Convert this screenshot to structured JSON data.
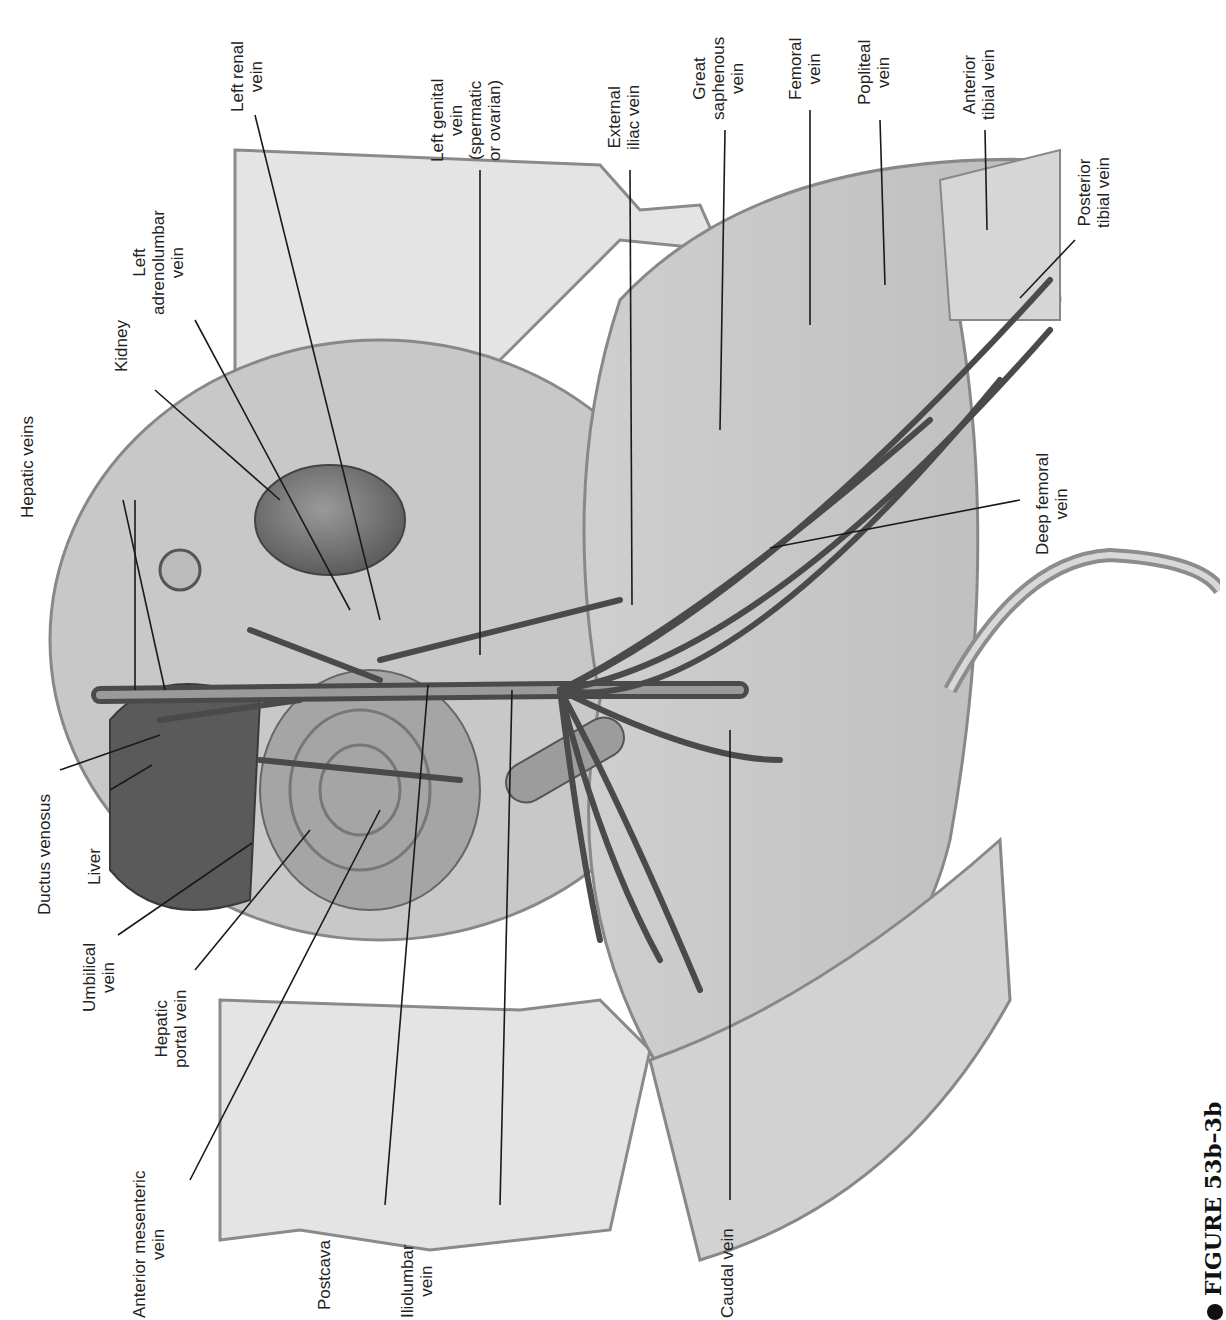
{
  "figure": {
    "caption": "FIGURE 53b–3b"
  },
  "labels": {
    "hepatic_veins": [
      "Hepatic veins"
    ],
    "kidney": [
      "Kidney"
    ],
    "left_adrenolumbar_vein": [
      "Left",
      "adrenolumbar",
      "vein"
    ],
    "left_renal_vein": [
      "Left renal",
      "vein"
    ],
    "left_genital_vein": [
      "Left genital",
      "vein",
      "(spermatic",
      "or ovarian)"
    ],
    "external_iliac_vein": [
      "External",
      "iliac vein"
    ],
    "great_saphenous_vein": [
      "Great",
      "saphenous",
      "vein"
    ],
    "femoral_vein": [
      "Femoral",
      "vein"
    ],
    "popliteal_vein": [
      "Popliteal",
      "vein"
    ],
    "anterior_tibial_vein": [
      "Anterior",
      "tibial vein"
    ],
    "posterior_tibial_vein": [
      "Posterior",
      "tibial vein"
    ],
    "deep_femoral_vein": [
      "Deep femoral",
      "vein"
    ],
    "ductus_venosus": [
      "Ductus venosus"
    ],
    "liver": [
      "Liver"
    ],
    "umbilical_vein": [
      "Umbilical",
      "vein"
    ],
    "hepatic_portal_vein": [
      "Hepatic",
      "portal vein"
    ],
    "anterior_mesenteric_vein": [
      "Anterior mesenteric",
      "vein"
    ],
    "postcava": [
      "Postcava"
    ],
    "iliolumbar_vein": [
      "Iliolumbar",
      "vein"
    ],
    "caudal_vein": [
      "Caudal vein"
    ]
  },
  "colors": {
    "background": "#ffffff",
    "tissue_light": "#d9d9d9",
    "tissue_mid": "#b5b5b5",
    "organ_dark": "#6e6e6e",
    "vessel": "#4a4a4a",
    "leader_line": "#1a1a1a"
  }
}
